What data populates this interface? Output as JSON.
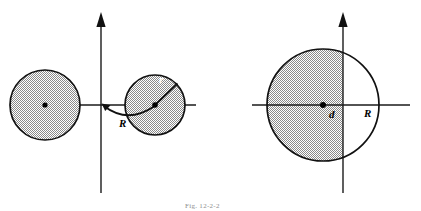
{
  "figure": {
    "caption": "Fig. 12-2-2",
    "colors": {
      "ink": "#111111",
      "shade_gray": "#b9b9b9",
      "background": "#ffffff",
      "light_label": "#ffffff"
    },
    "panels": [
      {
        "id": "left-panel",
        "name": "two-circles-offset-panel",
        "axes": {
          "vertical_axis_x": 101,
          "horizontal_axis_y": 105,
          "vertical_arrow": "up",
          "horizontal_extent": [
            10,
            196
          ],
          "vertical_extent": [
            13,
            193
          ]
        },
        "shapes": [
          {
            "name": "left-shaded-circle",
            "type": "circle",
            "cx": 45,
            "cy": 105,
            "r": 35,
            "shaded": "full",
            "center_dot": true
          },
          {
            "name": "right-shaded-circle",
            "type": "circle",
            "cx": 155,
            "cy": 105,
            "r": 30,
            "shaded": "full",
            "center_dot": true
          }
        ],
        "labels": [
          {
            "name": "label-R-arc",
            "text": "R",
            "x": 122,
            "y": 126,
            "style": "dark"
          },
          {
            "name": "label-r-radius",
            "text": "r",
            "x": 161,
            "y": 82,
            "style": "light"
          }
        ],
        "leaders": [
          {
            "name": "arc-R-leader",
            "from": "origin",
            "to": "right-circle-center",
            "arrow_at": "origin"
          },
          {
            "name": "radius-r-leader",
            "from": "right-circle-center",
            "to": "circle-edge-upper-right",
            "arrow_at": "none"
          }
        ]
      },
      {
        "id": "right-panel",
        "name": "half-shaded-circle-panel",
        "axes": {
          "vertical_axis_x": 343,
          "horizontal_axis_y": 105,
          "vertical_arrow": "up",
          "horizontal_extent": [
            252,
            410
          ],
          "vertical_extent": [
            13,
            193
          ]
        },
        "shapes": [
          {
            "name": "big-circle",
            "type": "circle",
            "cx": 323,
            "cy": 105,
            "r": 56,
            "shaded": "left-of-vertical-axis",
            "center_dot": true
          }
        ],
        "labels": [
          {
            "name": "label-d-offset",
            "text": "d",
            "x": 331,
            "y": 117,
            "style": "dark"
          },
          {
            "name": "label-R-radius",
            "text": "R",
            "x": 366,
            "y": 116,
            "style": "dark"
          }
        ]
      }
    ]
  }
}
